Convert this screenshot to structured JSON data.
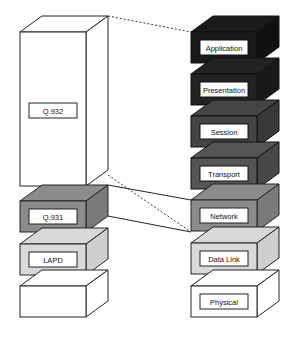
{
  "diagram": {
    "title": "",
    "left_stack": {
      "name": "ISDN protocol stack",
      "layers": [
        {
          "label": "Q.932",
          "fill": "#ffffff"
        },
        {
          "label": "Q.931",
          "fill": "#8c8c8c"
        },
        {
          "label": "LAPD",
          "fill": "#d9d9d9"
        },
        {
          "label": "",
          "fill": "#ffffff"
        }
      ]
    },
    "right_stack": {
      "name": "OSI reference model",
      "layers": [
        {
          "label": "Application",
          "fill": "#1a1a1a"
        },
        {
          "label": "Presentation",
          "fill": "#222222"
        },
        {
          "label": "Session",
          "fill": "#444444"
        },
        {
          "label": "Transport",
          "fill": "#555555"
        },
        {
          "label": "Network",
          "fill": "#8c8c8c"
        },
        {
          "label": "Data Link",
          "fill": "#d9d9d9"
        },
        {
          "label": "Physical",
          "fill": "#ffffff"
        }
      ]
    },
    "connectors": [
      {
        "from": "Q.932",
        "to": "Application-Network",
        "style": "dotted"
      },
      {
        "from": "Q.931",
        "to": "Network",
        "style": "solid"
      }
    ]
  }
}
